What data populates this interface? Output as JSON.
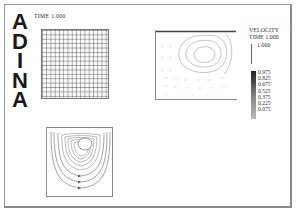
{
  "logo": {
    "letters": [
      "A",
      "D",
      "I",
      "N",
      "A"
    ]
  },
  "mesh_plot": {
    "time_label": "TIME 1.000"
  },
  "legend": {
    "title": "VELOCITY",
    "time_label": "TIME 1.000",
    "reference_value": "1.000",
    "ticks": [
      "0.975",
      "0.825",
      "0.675",
      "0.525",
      "0.375",
      "0.225",
      "0.075"
    ]
  },
  "colors": {
    "border": "#9a9a9a",
    "ink": "#222222",
    "background": "#ffffff"
  }
}
